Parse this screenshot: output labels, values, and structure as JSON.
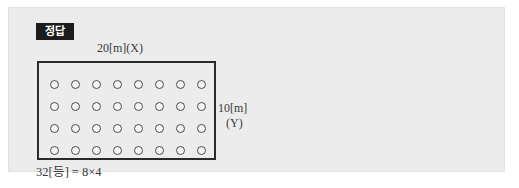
{
  "badge": {
    "label": "정답"
  },
  "figure": {
    "top_label": "20[m](X)",
    "right_label_line1": "10[m]",
    "right_label_line2": "(Y)",
    "room": {
      "columns": 8,
      "rows": 4,
      "lamp_count": 32,
      "lamp_icon": "circle-outline-icon"
    }
  },
  "formula": {
    "quantity": "32[등]",
    "equals": "=",
    "left_factor": "8",
    "times": "×",
    "right_factor": "4",
    "full": "32[등] = 8×4"
  },
  "colors": {
    "panel_background": "#ececec",
    "page_background": "#ffffff",
    "badge_background": "#1c1c1c",
    "badge_text": "#ffffff",
    "room_border": "#2a2a2a",
    "text": "#3a3a3a",
    "lamp_stroke": "#4a4a4a"
  }
}
